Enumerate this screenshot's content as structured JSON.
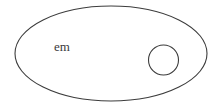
{
  "figure": {
    "type": "set-diagram",
    "background_color": "#ffffff",
    "stroke_color": "#3c3c3c",
    "text_color": "#3a3a3a",
    "outer_shape": {
      "name": "outer-ellipse",
      "shape": "ellipse",
      "center_x": 111,
      "center_y": 53.5,
      "radius_x": 96,
      "radius_y": 47.5,
      "stroke_width": 1.1,
      "fill": "none"
    },
    "inner_shape": {
      "name": "inner-circle",
      "shape": "circle",
      "center_x": 163.5,
      "center_y": 60,
      "radius": 15,
      "stroke_width": 1.1,
      "fill": "none"
    },
    "label": {
      "text": "em",
      "x": 62,
      "y": 48,
      "font_size": 13
    }
  }
}
